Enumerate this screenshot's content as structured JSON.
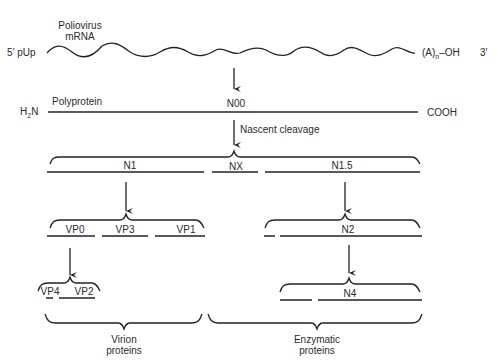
{
  "diagram": {
    "mrna": {
      "title_line1": "Poliovirus",
      "title_line2": "mRNA",
      "five_prime_end": "5′ pUp",
      "poly_a_tail": "(A)",
      "poly_a_sub": "n",
      "poly_a_suffix": "–OH",
      "three_prime_end": "3′"
    },
    "polyprotein": {
      "label": "Polyprotein",
      "name": "N00",
      "n_terminus": "H",
      "n_terminus_sub": "2",
      "n_terminus_suffix": "N",
      "c_terminus": "COOH"
    },
    "cleavage_label": "Nascent cleavage",
    "primary_products": [
      {
        "name": "N1"
      },
      {
        "name": "NX"
      },
      {
        "name": "N1.5"
      }
    ],
    "n1_products": [
      {
        "name": "VP0"
      },
      {
        "name": "VP3"
      },
      {
        "name": "VP1"
      }
    ],
    "n15_products": [
      {
        "name": "N2"
      }
    ],
    "vp0_products": [
      {
        "name": "VP4"
      },
      {
        "name": "VP2"
      }
    ],
    "n2_products": [
      {
        "name": "N4"
      }
    ],
    "groups": [
      {
        "line1": "Virion",
        "line2": "proteins"
      },
      {
        "line1": "Enzymatic",
        "line2": "proteins"
      }
    ],
    "colors": {
      "ink": "#222222",
      "background": "#ffffff"
    }
  }
}
